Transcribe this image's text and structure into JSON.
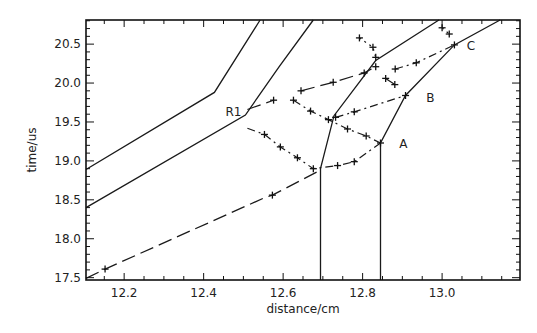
{
  "chart_data": {
    "type": "line",
    "title": "",
    "xlabel": "distance/cm",
    "ylabel": "time/us",
    "xlim": [
      12.104,
      13.196
    ],
    "ylim": [
      17.47,
      20.81
    ],
    "xticks": [
      12.2,
      12.4,
      12.6,
      12.8,
      13.0
    ],
    "xtick_labels": [
      "12.2",
      "12.4",
      "12.6",
      "12.8",
      "13.0"
    ],
    "yticks": [
      17.5,
      18.0,
      18.5,
      19.0,
      19.5,
      20.0,
      20.5
    ],
    "ytick_labels": [
      "17.5",
      "18.0",
      "18.5",
      "19.0",
      "19.5",
      "20.0",
      "20.5"
    ],
    "x_minor_step": 0.05,
    "y_minor_step": 0.1,
    "grid": false,
    "legend": null,
    "series": [
      {
        "name": "solid-line-1",
        "style": "solid",
        "x": [
          12.104,
          12.427,
          12.542
        ],
        "y": [
          18.89,
          19.88,
          20.81
        ]
      },
      {
        "name": "solid-line-2",
        "style": "solid",
        "x": [
          12.104,
          12.505,
          12.59,
          12.676
        ],
        "y": [
          18.4,
          19.59,
          20.21,
          20.81
        ]
      },
      {
        "name": "solid-line-3",
        "style": "solid",
        "x": [
          12.694,
          12.694,
          12.728,
          12.833,
          12.992
        ],
        "y": [
          17.47,
          18.9,
          19.58,
          20.29,
          20.81
        ]
      },
      {
        "name": "solid-line-4",
        "style": "solid",
        "x": [
          12.845,
          12.845,
          12.908,
          13.031,
          13.146
        ],
        "y": [
          17.47,
          19.23,
          19.84,
          20.49,
          20.81
        ]
      },
      {
        "name": "lower-dashed-line",
        "style": "long-dash",
        "x": [
          12.104,
          12.152,
          12.55,
          12.573,
          12.69
        ],
        "y": [
          17.49,
          17.61,
          18.52,
          18.56,
          18.87
        ]
      }
    ],
    "paths": [
      {
        "name": "R1-to-A-lower",
        "style": "dash-dot",
        "x": [
          12.51,
          12.553,
          12.593,
          12.636,
          12.676,
          12.737,
          12.779,
          12.845
        ],
        "y": [
          19.42,
          19.34,
          19.18,
          19.04,
          18.9,
          18.94,
          18.99,
          19.23
        ]
      },
      {
        "name": "R1-upper-short",
        "style": "long-dash",
        "x": [
          12.51,
          12.576
        ],
        "y": [
          19.66,
          19.78
        ]
      },
      {
        "name": "upper-to-junction",
        "style": "long-dash",
        "x": [
          12.645,
          12.726,
          12.804,
          12.833
        ],
        "y": [
          19.9,
          20.01,
          20.13,
          20.21
        ]
      },
      {
        "name": "middle-to-A",
        "style": "dash-dot",
        "x": [
          12.626,
          12.669,
          12.714,
          12.762,
          12.809,
          12.845
        ],
        "y": [
          19.78,
          19.64,
          19.53,
          19.41,
          19.32,
          19.23
        ]
      },
      {
        "name": "to-B",
        "style": "dash-dot",
        "x": [
          12.732,
          12.779,
          12.908
        ],
        "y": [
          19.56,
          19.63,
          19.84
        ]
      },
      {
        "name": "to-C",
        "style": "dash-dot",
        "x": [
          12.882,
          12.935,
          13.031
        ],
        "y": [
          20.18,
          20.26,
          20.49
        ]
      },
      {
        "name": "upper-column",
        "style": "dotted",
        "x": [
          12.792,
          12.826,
          12.833
        ],
        "y": [
          20.58,
          20.46,
          20.33
        ]
      },
      {
        "name": "junction-short",
        "style": "long-dash",
        "x": [
          12.858,
          12.881
        ],
        "y": [
          20.06,
          19.98
        ]
      },
      {
        "name": "C-upper-short",
        "style": "dotted",
        "x": [
          13.0,
          13.018
        ],
        "y": [
          20.71,
          20.63
        ]
      }
    ],
    "markers": [
      [
        12.152,
        17.61
      ],
      [
        12.573,
        18.56
      ],
      [
        12.553,
        19.34
      ],
      [
        12.593,
        19.18
      ],
      [
        12.636,
        19.04
      ],
      [
        12.676,
        18.9
      ],
      [
        12.737,
        18.94
      ],
      [
        12.779,
        18.99
      ],
      [
        12.845,
        19.23
      ],
      [
        12.576,
        19.78
      ],
      [
        12.626,
        19.78
      ],
      [
        12.645,
        19.9
      ],
      [
        12.726,
        20.01
      ],
      [
        12.804,
        20.13
      ],
      [
        12.833,
        20.21
      ],
      [
        12.669,
        19.64
      ],
      [
        12.714,
        19.53
      ],
      [
        12.762,
        19.41
      ],
      [
        12.809,
        19.32
      ],
      [
        12.732,
        19.56
      ],
      [
        12.779,
        19.63
      ],
      [
        12.908,
        19.84
      ],
      [
        12.882,
        20.18
      ],
      [
        12.935,
        20.26
      ],
      [
        13.031,
        20.49
      ],
      [
        12.792,
        20.58
      ],
      [
        12.826,
        20.46
      ],
      [
        12.833,
        20.33
      ],
      [
        12.858,
        20.06
      ],
      [
        12.881,
        19.98
      ],
      [
        13.0,
        20.71
      ],
      [
        13.018,
        20.63
      ]
    ],
    "annotations": [
      {
        "text": "R1",
        "x": 12.455,
        "y": 19.58
      },
      {
        "text": "A",
        "x": 12.892,
        "y": 19.16
      },
      {
        "text": "B",
        "x": 12.96,
        "y": 19.76
      },
      {
        "text": "C",
        "x": 13.062,
        "y": 20.42
      }
    ]
  },
  "caption": ""
}
